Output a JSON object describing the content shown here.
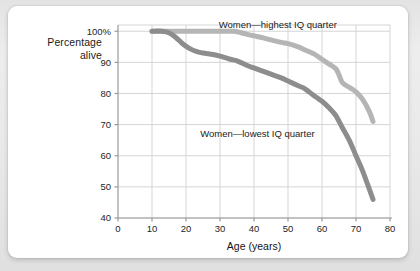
{
  "card": {
    "background": "#ffffff",
    "page_background": "#e8e8e8"
  },
  "chart_data": {
    "type": "line",
    "title": "",
    "subtitle": "",
    "xlabel": "Age (years)",
    "ylabel": "Percentage\nalive",
    "ylabel_line1": "Percentage",
    "ylabel_line2": "alive",
    "xlim": [
      0,
      80
    ],
    "ylim": [
      40,
      102
    ],
    "xticks": [
      0,
      10,
      20,
      30,
      40,
      50,
      60,
      70,
      80
    ],
    "xtick_labels": [
      "0",
      "10",
      "20",
      "30",
      "40",
      "50",
      "60",
      "70",
      "80"
    ],
    "yticks": [
      40,
      50,
      60,
      70,
      80,
      90,
      100
    ],
    "ytick_labels": [
      "40",
      "50",
      "60",
      "70",
      "80",
      "90",
      "100%"
    ],
    "grid": true,
    "grid_color": "#d5d5d5",
    "legend_position": "inline-annotation",
    "annotations": [
      {
        "text": "Women—highest IQ quarter",
        "x": 47,
        "y": 101,
        "series": "highest-iq"
      },
      {
        "text": "Women—lowest IQ quarter",
        "x": 41,
        "y": 66,
        "series": "lowest-iq"
      }
    ],
    "series": [
      {
        "name": "Women—highest IQ quarter",
        "color": "#b5b5b5",
        "line_width": 5,
        "x": [
          10,
          15,
          20,
          25,
          30,
          34,
          36,
          38,
          40,
          43,
          45,
          48,
          50,
          53,
          55,
          58,
          60,
          62,
          64,
          65,
          66,
          68,
          70,
          72,
          74,
          75
        ],
        "values": [
          100,
          100,
          100,
          100,
          100,
          100,
          99.6,
          99,
          98.5,
          97.8,
          97.2,
          96.4,
          96,
          95,
          94,
          92.5,
          91,
          89.5,
          88,
          86,
          83.5,
          82,
          80.5,
          78,
          74,
          71
        ]
      },
      {
        "name": "Women—lowest IQ quarter",
        "color": "#8d8d8d",
        "line_width": 5,
        "x": [
          10,
          13,
          15,
          17,
          19,
          21,
          23,
          25,
          28,
          30,
          33,
          35,
          38,
          40,
          43,
          45,
          48,
          50,
          53,
          55,
          58,
          60,
          62,
          64,
          66,
          68,
          70,
          72,
          74,
          75
        ],
        "values": [
          100,
          100,
          99.5,
          98,
          96,
          94.5,
          93.5,
          93,
          92.5,
          92,
          91,
          90.5,
          89,
          88.2,
          87,
          86.2,
          85,
          84,
          82.5,
          81.5,
          79,
          77.5,
          75.5,
          73,
          69,
          65,
          60,
          55,
          49,
          46
        ]
      }
    ]
  }
}
